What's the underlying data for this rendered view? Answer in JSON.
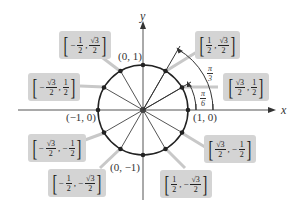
{
  "diagram": {
    "axes": {
      "x_label": "x",
      "y_label": "y"
    },
    "axis_points": {
      "top": "(0, 1)",
      "left": "(−1, 0)",
      "right": "(1, 0)",
      "bottom": "(0, −1)"
    },
    "angles": [
      {
        "num": "π",
        "den": "3"
      },
      {
        "num": "π",
        "den": "6"
      }
    ],
    "points": [
      {
        "xs": "",
        "xn": "1",
        "xd": "2",
        "ys": "",
        "yn": "√3",
        "yd": "2"
      },
      {
        "xs": "",
        "xn": "√3",
        "xd": "2",
        "ys": "",
        "yn": "1",
        "yd": "2"
      },
      {
        "xs": "−",
        "xn": "1",
        "xd": "2",
        "ys": "",
        "yn": "√3",
        "yd": "2"
      },
      {
        "xs": "−",
        "xn": "√3",
        "xd": "2",
        "ys": "",
        "yn": "1",
        "yd": "2"
      },
      {
        "xs": "−",
        "xn": "√3",
        "xd": "2",
        "ys": "−",
        "yn": "1",
        "yd": "2"
      },
      {
        "xs": "−",
        "xn": "1",
        "xd": "2",
        "ys": "−",
        "yn": "√3",
        "yd": "2"
      },
      {
        "xs": "",
        "xn": "√3",
        "xd": "2",
        "ys": "−",
        "yn": "1",
        "yd": "2"
      },
      {
        "xs": "",
        "xn": "1",
        "xd": "2",
        "ys": "−",
        "yn": "√3",
        "yd": "2"
      }
    ],
    "colors": {
      "box_fill": "#d4d4d4",
      "leader": "#c8c8c8",
      "line": "#222222"
    }
  }
}
